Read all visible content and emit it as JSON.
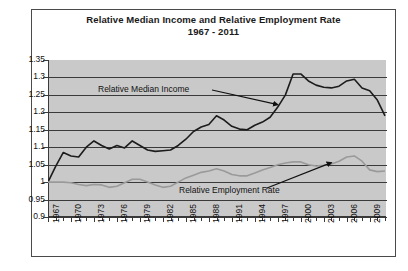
{
  "chart_data": {
    "type": "line",
    "title": "Relative Median Income and Relative Employment Rate",
    "subtitle": "1967 - 2011",
    "xlabel": "",
    "ylabel": "",
    "ylim": [
      0.9,
      1.35
    ],
    "ytick_step": 0.05,
    "yticks": [
      "1.35",
      "1.3",
      "1.25",
      "1.2",
      "1.15",
      "1.1",
      "1.05",
      "1",
      "0.95",
      "0.9"
    ],
    "grid": true,
    "legend_position": "inline-annotations",
    "plot_background": "#c9c9c9",
    "xlim": [
      1967,
      2011
    ],
    "xtick_labels": [
      "1967",
      "1970",
      "1973",
      "1976",
      "1979",
      "1982",
      "1985",
      "1988",
      "1991",
      "1994",
      "1997",
      "2000",
      "2003",
      "2006",
      "2009"
    ],
    "x": [
      1967,
      1968,
      1969,
      1970,
      1971,
      1972,
      1973,
      1974,
      1975,
      1976,
      1977,
      1978,
      1979,
      1980,
      1981,
      1982,
      1983,
      1984,
      1985,
      1986,
      1987,
      1988,
      1989,
      1990,
      1991,
      1992,
      1993,
      1994,
      1995,
      1996,
      1997,
      1998,
      1999,
      2000,
      2001,
      2002,
      2003,
      2004,
      2005,
      2006,
      2007,
      2008,
      2009,
      2010,
      2011
    ],
    "series": [
      {
        "name": "Relative Median Income",
        "color": "#1c1c1c",
        "values": [
          1.0,
          1.045,
          1.085,
          1.075,
          1.072,
          1.1,
          1.118,
          1.105,
          1.095,
          1.105,
          1.098,
          1.118,
          1.105,
          1.092,
          1.088,
          1.09,
          1.092,
          1.105,
          1.123,
          1.145,
          1.158,
          1.165,
          1.19,
          1.178,
          1.16,
          1.152,
          1.15,
          1.163,
          1.172,
          1.186,
          1.215,
          1.25,
          1.31,
          1.31,
          1.29,
          1.278,
          1.272,
          1.27,
          1.275,
          1.29,
          1.295,
          1.27,
          1.262,
          1.235,
          1.19
        ]
      },
      {
        "name": "Relative Employment Rate",
        "color": "#9a9a9a",
        "values": [
          1.0,
          1.0,
          1.0,
          0.998,
          0.993,
          0.99,
          0.993,
          0.992,
          0.985,
          0.988,
          0.998,
          1.008,
          1.008,
          1.0,
          0.992,
          0.985,
          0.988,
          1.0,
          1.012,
          1.02,
          1.028,
          1.032,
          1.038,
          1.032,
          1.022,
          1.018,
          1.018,
          1.026,
          1.035,
          1.042,
          1.05,
          1.055,
          1.058,
          1.058,
          1.05,
          1.046,
          1.048,
          1.052,
          1.06,
          1.072,
          1.075,
          1.06,
          1.035,
          1.03,
          1.032
        ]
      }
    ],
    "annotations": [
      {
        "text": "Relative Median Income",
        "target_x": 1997,
        "target_y": 1.222
      },
      {
        "text": "Relative Employment Rate",
        "target_x": 2004,
        "target_y": 1.056
      }
    ]
  }
}
